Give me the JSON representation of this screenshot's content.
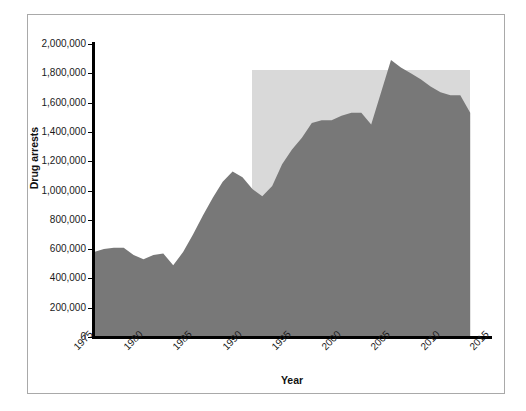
{
  "chart_data": {
    "type": "area",
    "title": "",
    "xlabel": "Year",
    "ylabel": "Drug arrests",
    "xlim": [
      1975,
      2015
    ],
    "ylim": [
      0,
      2000000
    ],
    "grid": false,
    "legend": null,
    "y_ticks": [
      0,
      200000,
      400000,
      600000,
      800000,
      1000000,
      1200000,
      1400000,
      1600000,
      1800000,
      2000000
    ],
    "y_tick_labels": [
      "0",
      "200,000",
      "400,000",
      "600,000",
      "800,000",
      "1,000,000",
      "1,200,000",
      "1,400,000",
      "1,600,000",
      "1,800,000",
      "2,000,000"
    ],
    "x_ticks": [
      1975,
      1980,
      1985,
      1990,
      1995,
      2000,
      2005,
      2010,
      2015
    ],
    "x_tick_labels": [
      "1975",
      "1980",
      "1985",
      "1990",
      "1995",
      "2000",
      "2005",
      "2010",
      "2015"
    ],
    "series": [
      {
        "name": "Drug arrests",
        "color": "#787878",
        "x": [
          1975,
          1976,
          1977,
          1978,
          1979,
          1980,
          1981,
          1982,
          1983,
          1984,
          1985,
          1986,
          1987,
          1988,
          1989,
          1990,
          1991,
          1992,
          1993,
          1994,
          1995,
          1996,
          1997,
          1998,
          1999,
          2000,
          2001,
          2002,
          2003,
          2004,
          2005,
          2006,
          2007,
          2008,
          2009,
          2010,
          2011,
          2012,
          2013
        ],
        "values": [
          580000,
          600000,
          610000,
          610000,
          560000,
          530000,
          560000,
          570000,
          490000,
          580000,
          700000,
          830000,
          950000,
          1060000,
          1130000,
          1090000,
          1010000,
          960000,
          1030000,
          1180000,
          1280000,
          1360000,
          1460000,
          1480000,
          1480000,
          1510000,
          1530000,
          1530000,
          1450000,
          1670000,
          1890000,
          1840000,
          1800000,
          1760000,
          1710000,
          1670000,
          1650000,
          1650000,
          1530000
        ]
      }
    ],
    "shaded_region": {
      "label": "",
      "color": "#d9d9d9",
      "x_start": 1991,
      "x_end": 2013,
      "y_start": 0,
      "y_end": 1820000
    }
  },
  "axes": {
    "y_title": "Drug arrests",
    "x_title": "Year"
  }
}
